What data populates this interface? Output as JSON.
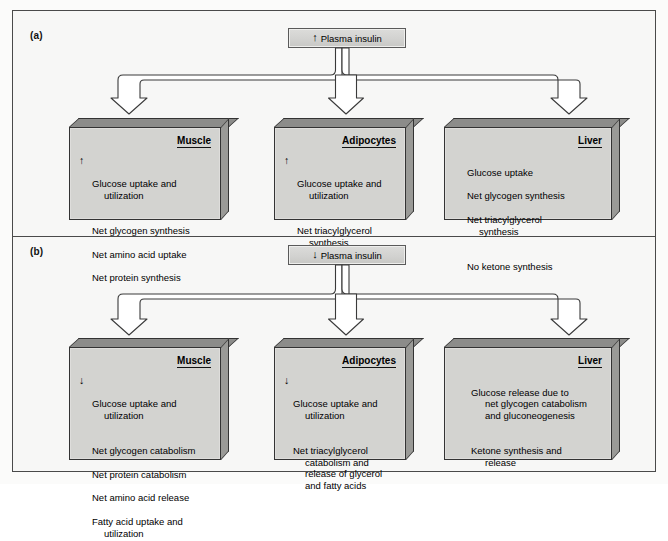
{
  "figure": {
    "background_color": "#f7f7f6",
    "box_fill_color": "#d3d3d0",
    "box_top_color": "#8c8c8a",
    "border_color": "#333333"
  },
  "panels": [
    {
      "id": "a",
      "label": "(a)",
      "source": {
        "arrow_icon": "up-arrow-icon",
        "arrow_glyph": "↑",
        "text": "Plasma insulin"
      },
      "tissues": [
        {
          "name": "Muscle",
          "items": [
            {
              "dir": "↑",
              "text": "Glucose uptake and",
              "cont": "utilization"
            },
            {
              "dir": "",
              "text": "Net glycogen synthesis",
              "cont": ""
            },
            {
              "dir": "",
              "text": "Net amino acid uptake",
              "cont": ""
            },
            {
              "dir": "",
              "text": "Net protein synthesis",
              "cont": ""
            }
          ]
        },
        {
          "name": "Adipocytes",
          "items": [
            {
              "dir": "↑",
              "text": "Glucose uptake and",
              "cont": "utilization"
            },
            {
              "dir": "",
              "text": "Net triacylglycerol",
              "cont": "synthesis"
            }
          ]
        },
        {
          "name": "Liver",
          "items": [
            {
              "dir": "",
              "text": "Glucose uptake",
              "cont": ""
            },
            {
              "dir": "",
              "text": "Net glycogen synthesis",
              "cont": ""
            },
            {
              "dir": "",
              "text": "Net triacylglycerol",
              "cont": "synthesis"
            },
            {
              "dir": "",
              "text": "No ketone synthesis",
              "cont": ""
            }
          ]
        }
      ]
    },
    {
      "id": "b",
      "label": "(b)",
      "source": {
        "arrow_icon": "down-arrow-icon",
        "arrow_glyph": "↓",
        "text": "Plasma insulin"
      },
      "tissues": [
        {
          "name": "Muscle",
          "items": [
            {
              "dir": "↓",
              "text": "Glucose uptake and",
              "cont": "utilization"
            },
            {
              "dir": "",
              "text": "Net glycogen catabolism",
              "cont": ""
            },
            {
              "dir": "",
              "text": "Net protein catabolism",
              "cont": ""
            },
            {
              "dir": "",
              "text": "Net amino acid release",
              "cont": ""
            },
            {
              "dir": "",
              "text": "Fatty acid uptake and",
              "cont": "utilization"
            }
          ]
        },
        {
          "name": "Adipocytes",
          "items": [
            {
              "dir": "↓",
              "text": "Glucose uptake and",
              "cont": "utilization"
            },
            {
              "dir": "",
              "text": "Net triacylglycerol",
              "cont": "catabolism and\nrelease of glycerol\nand fatty acids"
            }
          ]
        },
        {
          "name": "Liver",
          "items": [
            {
              "dir": "",
              "text": "Glucose release due to",
              "cont": "net glycogen catabolism\nand gluconeogenesis"
            },
            {
              "dir": "",
              "text": "Ketone synthesis and",
              "cont": "release"
            }
          ]
        }
      ]
    }
  ]
}
